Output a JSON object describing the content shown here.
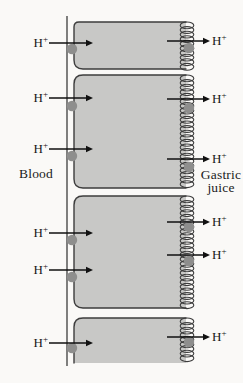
{
  "figure": {
    "left_label": "Blood",
    "right_label_line1": "Gastric",
    "right_label_line2": "juice",
    "ion_symbol": "H",
    "ion_charge": "+",
    "colors": {
      "background": "#faf9f7",
      "cell_fill": "#c8c8c6",
      "outline": "#3d3d3d",
      "pump": "#8e8e8d",
      "arrow": "#111111",
      "text": "#161616"
    },
    "geometry": {
      "width": 243,
      "height": 383,
      "blood_membrane_x": 67,
      "blood_membrane_top": 16,
      "blood_membrane_bottom": 366,
      "cell_left": 74,
      "cell_right": 186,
      "coil_center_x": 187,
      "coil_loop_rx": 6.8,
      "coil_loop_ry": 3.4,
      "coil_pitch": 4.6,
      "pump_radius": 5.2,
      "left_pump_x": 72,
      "right_pump_x": 189,
      "left_arrow_x1": 49,
      "left_arrow_x2": 93,
      "right_arrow_x1": 167,
      "right_arrow_x2": 210,
      "left_ion_right_edge": 48,
      "right_ion_left_edge": 212
    },
    "cells": [
      {
        "top": 22,
        "bottom": 69,
        "open_bottom": false,
        "top_radius": 5,
        "bottom_radius": 9,
        "left_arrows": [
          {
            "y": 43,
            "pump_y": 49
          }
        ],
        "right_arrows": [
          {
            "y": 41,
            "pump_y": 48
          }
        ]
      },
      {
        "top": 75,
        "bottom": 188,
        "open_bottom": false,
        "top_radius": 9,
        "bottom_radius": 9,
        "left_arrows": [
          {
            "y": 98,
            "pump_y": 106
          },
          {
            "y": 149,
            "pump_y": 156
          }
        ],
        "right_arrows": [
          {
            "y": 99,
            "pump_y": 108
          },
          {
            "y": 159,
            "pump_y": 167
          }
        ]
      },
      {
        "top": 196,
        "bottom": 308,
        "open_bottom": false,
        "top_radius": 9,
        "bottom_radius": 9,
        "left_arrows": [
          {
            "y": 233,
            "pump_y": 240
          },
          {
            "y": 270,
            "pump_y": 277
          }
        ],
        "right_arrows": [
          {
            "y": 222,
            "pump_y": 227
          },
          {
            "y": 255,
            "pump_y": 261
          }
        ]
      },
      {
        "top": 318,
        "bottom": 363,
        "open_bottom": true,
        "top_radius": 9,
        "bottom_radius": 0,
        "left_arrows": [
          {
            "y": 343,
            "pump_y": 348
          }
        ],
        "right_arrows": [
          {
            "y": 337,
            "pump_y": 342
          }
        ]
      }
    ]
  }
}
